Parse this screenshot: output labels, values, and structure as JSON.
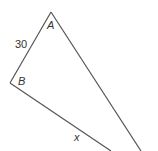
{
  "diagram": {
    "vertices": {
      "A": "A",
      "B": "B"
    },
    "side_AB_label": "30",
    "side_x_label": "x",
    "line_color": "#555555"
  }
}
